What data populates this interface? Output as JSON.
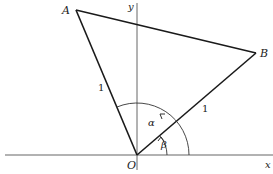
{
  "diagram": {
    "axes": {
      "x_label": "x",
      "y_label": "y"
    },
    "points": {
      "origin": {
        "label": "O",
        "x": 137,
        "y": 155
      },
      "A": {
        "label": "A",
        "x": 76,
        "y": 10
      },
      "B": {
        "label": "B",
        "x": 256,
        "y": 53
      }
    },
    "segments": {
      "OA_length": "1",
      "OB_length": "1"
    },
    "angles": {
      "alpha": "α",
      "beta": "β"
    },
    "colors": {
      "stroke": "#1a1a1a",
      "axis": "#555555",
      "background": "#ffffff"
    }
  }
}
